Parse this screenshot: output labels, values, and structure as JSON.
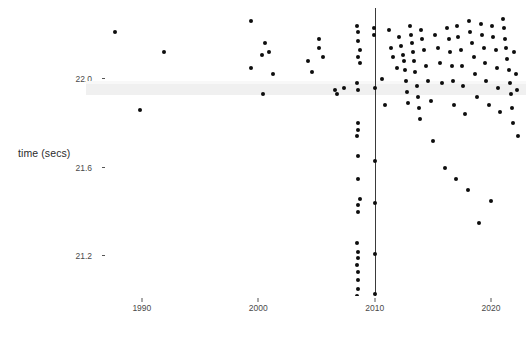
{
  "chart_data": {
    "type": "scatter",
    "title": "",
    "subtitle": "",
    "xlabel": "",
    "ylabel": "time (secs)",
    "xlim": [
      1985.2,
      2023.0
    ],
    "ylim": [
      21.02,
      22.32
    ],
    "grid": false,
    "legend": null,
    "x_ticks": [
      1990,
      2000,
      2010,
      2020
    ],
    "x_tick_labels": [
      "1990",
      "2000",
      "2010",
      "2020"
    ],
    "y_ticks": [
      22.0,
      21.6,
      21.2
    ],
    "y_tick_labels": [
      "22.0",
      "21.6",
      "21.2"
    ],
    "point_color": "#0d0d0d",
    "annotations": [
      {
        "name": "vertical-reference-line",
        "kind": "vline",
        "x": 2010,
        "color": "#3a3a3a"
      },
      {
        "name": "horizontal-shaded-band",
        "kind": "hband",
        "y_range": [
          21.925,
          21.975
        ],
        "color": "#f0f0f0"
      }
    ],
    "series": [
      {
        "name": "times",
        "x": [
          1987.7,
          1991.9,
          1989.8,
          1999.4,
          1999.4,
          2000.3,
          2000.6,
          2000.9,
          2000.4,
          2001.3,
          2004.3,
          2004.6,
          2005.2,
          2005.2,
          2005.6,
          2006.6,
          2006.8,
          2007.4,
          2008.5,
          2008.6,
          2008.6,
          2008.7,
          2008.6,
          2008.7,
          2008.5,
          2008.6,
          2008.6,
          2008.6,
          2008.5,
          2008.6,
          2008.6,
          2008.7,
          2008.6,
          2008.6,
          2008.5,
          2008.6,
          2008.6,
          2008.5,
          2008.6,
          2008.55,
          2008.6,
          2008.5,
          2009.9,
          2009.95,
          2010.0,
          2010.0,
          2010.0,
          2010.0,
          2010.0,
          2010.6,
          2010.9,
          2011.2,
          2011.4,
          2011.6,
          2011.9,
          2012.1,
          2012.3,
          2012.4,
          2012.5,
          2012.6,
          2012.7,
          2012.8,
          2012.9,
          2013.0,
          2013.1,
          2013.2,
          2013.3,
          2013.4,
          2013.5,
          2013.6,
          2013.7,
          2013.8,
          2013.9,
          2014.0,
          2014.1,
          2014.2,
          2014.4,
          2014.6,
          2014.8,
          2015.0,
          2015.2,
          2015.4,
          2015.6,
          2015.8,
          2016.0,
          2016.2,
          2016.4,
          2016.5,
          2016.6,
          2016.7,
          2016.8,
          2017.0,
          2017.1,
          2017.2,
          2017.4,
          2017.5,
          2017.6,
          2017.8,
          2018.0,
          2018.1,
          2018.2,
          2018.4,
          2018.5,
          2018.6,
          2018.8,
          2019.0,
          2019.1,
          2019.2,
          2019.4,
          2019.5,
          2019.6,
          2019.8,
          2020.0,
          2020.1,
          2020.2,
          2020.4,
          2020.5,
          2020.6,
          2020.8,
          2021.0,
          2021.1,
          2021.2,
          2021.3,
          2021.4,
          2021.5,
          2021.6,
          2021.7,
          2021.8,
          2021.9,
          2022.0,
          2022.1,
          2022.2,
          2022.3
        ],
        "y": [
          22.21,
          22.12,
          21.86,
          22.26,
          22.05,
          22.11,
          22.16,
          22.12,
          21.93,
          22.02,
          22.08,
          22.03,
          22.18,
          22.14,
          22.1,
          21.95,
          21.93,
          21.96,
          22.24,
          22.21,
          22.17,
          22.13,
          22.1,
          22.07,
          21.98,
          21.95,
          21.8,
          21.77,
          21.74,
          21.65,
          21.55,
          21.46,
          21.43,
          21.4,
          21.26,
          21.22,
          21.19,
          21.16,
          21.13,
          21.09,
          21.05,
          21.02,
          22.23,
          22.2,
          21.96,
          21.63,
          21.44,
          21.21,
          21.03,
          22.0,
          21.88,
          22.22,
          22.14,
          22.1,
          22.05,
          22.19,
          22.15,
          22.11,
          22.08,
          22.04,
          21.99,
          21.94,
          21.89,
          22.24,
          22.2,
          22.16,
          22.12,
          22.08,
          22.03,
          21.97,
          21.92,
          21.87,
          21.82,
          22.22,
          22.18,
          22.13,
          22.06,
          21.99,
          21.9,
          21.72,
          22.2,
          22.14,
          22.07,
          21.98,
          21.6,
          22.23,
          22.18,
          22.12,
          22.06,
          21.99,
          21.88,
          21.55,
          22.24,
          22.19,
          22.13,
          22.06,
          21.97,
          21.84,
          21.5,
          22.26,
          22.21,
          22.16,
          22.1,
          22.02,
          21.92,
          21.35,
          22.25,
          22.2,
          22.14,
          22.07,
          21.99,
          21.88,
          21.45,
          22.24,
          22.19,
          22.13,
          22.05,
          21.96,
          21.85,
          22.27,
          22.23,
          22.18,
          22.14,
          22.09,
          22.04,
          21.98,
          21.93,
          21.87,
          21.8,
          22.12,
          22.02,
          21.95,
          21.74
        ]
      }
    ]
  }
}
